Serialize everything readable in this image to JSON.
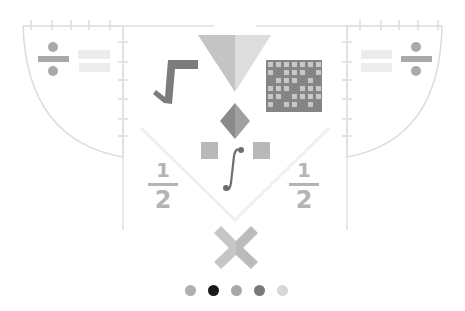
{
  "illustration": {
    "name": "math-symbols-illustration",
    "elements": [
      "divide-sign",
      "equals-sign",
      "square-root",
      "triangle",
      "grid",
      "diamond",
      "integral",
      "squares",
      "fraction-one-half",
      "multiply-sign"
    ]
  },
  "fractions": {
    "left": {
      "numerator": "1",
      "denominator": "2"
    },
    "right": {
      "numerator": "1",
      "denominator": "2"
    }
  },
  "pagination": {
    "count": 5,
    "active_index": 1,
    "colors": [
      "#b0b0b0",
      "#1a1a1a",
      "#a8a8a8",
      "#7a7a7a",
      "#d8d8d8"
    ]
  },
  "colors": {
    "line": "#dcdcdc",
    "dark": "#7c7c7c",
    "mid": "#a9a9a9",
    "light": "#cdcdcd",
    "lighter": "#e6e6e6"
  }
}
